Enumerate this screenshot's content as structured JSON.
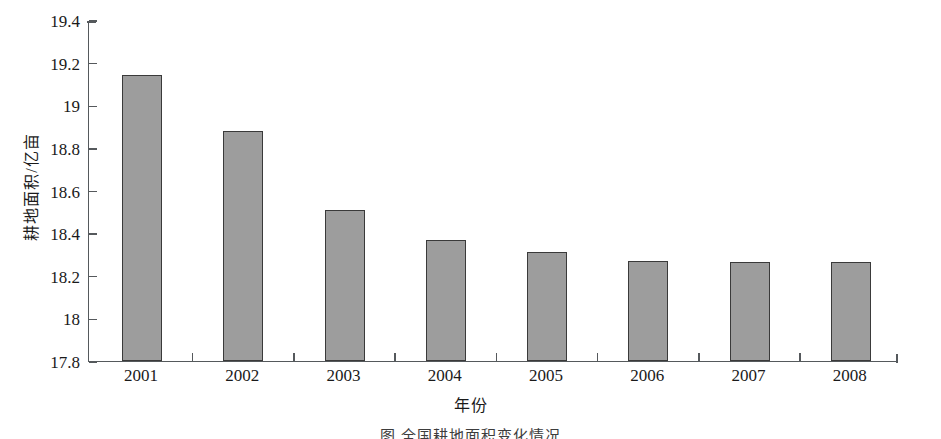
{
  "chart_data": {
    "type": "bar",
    "title": "",
    "subtitle": "",
    "categories": [
      "2001",
      "2002",
      "2003",
      "2004",
      "2005",
      "2006",
      "2007",
      "2008"
    ],
    "values": [
      19.14,
      18.88,
      18.51,
      18.37,
      18.31,
      18.27,
      18.265,
      18.265
    ],
    "series": [
      {
        "name": "耕地面积",
        "values": [
          19.14,
          18.88,
          18.51,
          18.37,
          18.31,
          18.27,
          18.265,
          18.265
        ]
      }
    ],
    "xlabel": "年份",
    "ylabel": "耕地面积/亿亩",
    "ylim": [
      17.8,
      19.4
    ],
    "ytick_labels": [
      "19.4",
      "19.2",
      "19",
      "18.8",
      "18.6",
      "18.4",
      "18.2",
      "18",
      "17.8"
    ],
    "ytick_values": [
      19.4,
      19.2,
      19.0,
      18.8,
      18.6,
      18.4,
      18.2,
      18.0,
      17.8
    ],
    "ytick_step": 0.2,
    "grid": false,
    "legend": null,
    "legend_position": "none",
    "bar_fill_color": "#9d9d9d",
    "bar_edge_color": "#3a3a3a",
    "axis_color": "#55595c",
    "background_color": "#ffffff",
    "annotations": []
  },
  "caption": {
    "text": "图 全国耕地面积变化情况"
  }
}
